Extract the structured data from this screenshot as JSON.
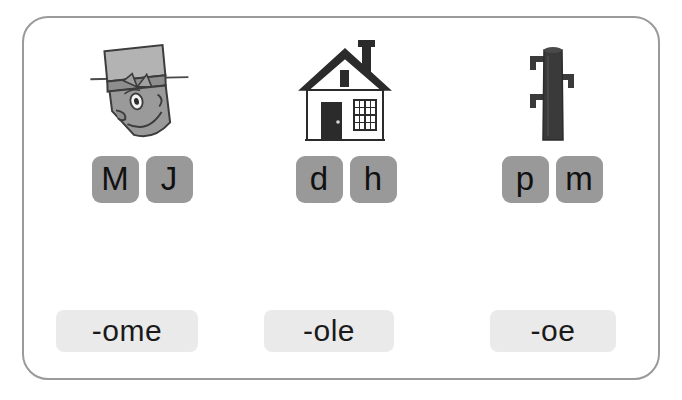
{
  "worksheet": {
    "title": "Onset and rime phonics matching worksheet",
    "frame_border_color": "#9a9a9a",
    "background_color": "#ffffff",
    "tile_color": "#999999",
    "rime_chip_color": "#eaeaea",
    "text_color": "#111111"
  },
  "columns": [
    {
      "picture": {
        "icon_name": "gnome-face-with-hat-illustration",
        "description": "Tilted cartoon face wearing a tall hat with band and bow, a diagonal hat pin, one eye, nose and smile",
        "fill": "#9a9a9a",
        "stroke": "#333333"
      },
      "tiles": [
        {
          "letter": "M"
        },
        {
          "letter": "J"
        }
      ],
      "rime": "-ome"
    },
    {
      "picture": {
        "icon_name": "house-illustration",
        "description": "Small house with peaked roof, chimney, dark front door, paned window and attic vent",
        "fill": "#ffffff",
        "stroke": "#2b2b2b"
      },
      "tiles": [
        {
          "letter": "d"
        },
        {
          "letter": "h"
        }
      ],
      "rime": "-ole"
    },
    {
      "picture": {
        "icon_name": "pole-illustration",
        "description": "Dark vertical pole with three small protruding pegs",
        "fill": "#3a3a3a",
        "stroke": "#2b2b2b"
      },
      "tiles": [
        {
          "letter": "p"
        },
        {
          "letter": "m"
        }
      ],
      "rime": "-oe"
    }
  ]
}
